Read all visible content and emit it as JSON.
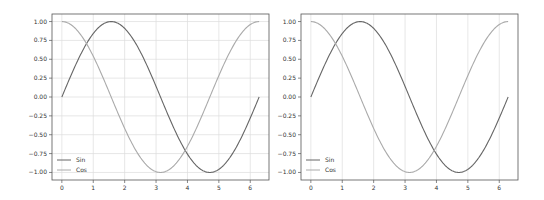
{
  "chart_data": [
    {
      "type": "line",
      "title": "",
      "xlabel": "",
      "ylabel": "",
      "xlim": [
        -0.314,
        6.597
      ],
      "ylim": [
        -1.1,
        1.1
      ],
      "x_ticks": [
        "0",
        "1",
        "2",
        "3",
        "4",
        "5",
        "6"
      ],
      "y_ticks": [
        "1.00",
        "0.75",
        "0.50",
        "0.25",
        "0.00",
        "−0.25",
        "−0.50",
        "−0.75",
        "−1.00"
      ],
      "grid": "both",
      "legend_position": "lower left",
      "x": {
        "start": 0,
        "end": 6.283,
        "description": "0 to 2π"
      },
      "series": [
        {
          "name": "Sin",
          "function": "sin(x)",
          "color": "#666666",
          "x": [
            0,
            0.785,
            1.571,
            2.356,
            3.142,
            3.927,
            4.712,
            5.498,
            6.283
          ],
          "values": [
            0.0,
            0.707,
            1.0,
            0.707,
            0.0,
            -0.707,
            -1.0,
            -0.707,
            0.0
          ]
        },
        {
          "name": "Cos",
          "function": "cos(x)",
          "color": "#aaaaaa",
          "x": [
            0,
            0.785,
            1.571,
            2.356,
            3.142,
            3.927,
            4.712,
            5.498,
            6.283
          ],
          "values": [
            1.0,
            0.707,
            0.0,
            -0.707,
            -1.0,
            -0.707,
            0.0,
            0.707,
            1.0
          ]
        }
      ]
    },
    {
      "type": "line",
      "title": "",
      "xlabel": "",
      "ylabel": "",
      "xlim": [
        -0.314,
        6.597
      ],
      "ylim": [
        -1.1,
        1.1
      ],
      "x_ticks": [
        "0",
        "1",
        "2",
        "3",
        "4",
        "5",
        "6"
      ],
      "y_ticks": [
        "1.00",
        "0.75",
        "0.50",
        "0.25",
        "0.00",
        "−0.25",
        "−0.50",
        "−0.75",
        "−1.00"
      ],
      "grid": "x",
      "legend_position": "lower left",
      "x": {
        "start": 0,
        "end": 6.283,
        "description": "0 to 2π"
      },
      "series": [
        {
          "name": "Sin",
          "function": "sin(x)",
          "color": "#666666",
          "x": [
            0,
            0.785,
            1.571,
            2.356,
            3.142,
            3.927,
            4.712,
            5.498,
            6.283
          ],
          "values": [
            0.0,
            0.707,
            1.0,
            0.707,
            0.0,
            -0.707,
            -1.0,
            -0.707,
            0.0
          ]
        },
        {
          "name": "Cos",
          "function": "cos(x)",
          "color": "#aaaaaa",
          "x": [
            0,
            0.785,
            1.571,
            2.356,
            3.142,
            3.927,
            4.712,
            5.498,
            6.283
          ],
          "values": [
            1.0,
            0.707,
            0.0,
            -0.707,
            -1.0,
            -0.707,
            0.0,
            0.707,
            1.0
          ]
        }
      ]
    }
  ],
  "charts": [
    {
      "legend": {
        "sin_label": "Sin",
        "cos_label": "Cos"
      }
    },
    {
      "legend": {
        "sin_label": "Sin",
        "cos_label": "Cos"
      }
    }
  ]
}
